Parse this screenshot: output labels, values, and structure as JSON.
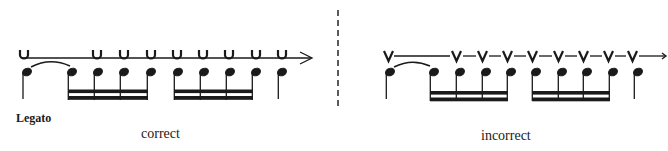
{
  "figure": {
    "section_label": "Legato",
    "panels": [
      {
        "caption": "correct",
        "bow_mark_symbol": "U",
        "bow_mark_count": 9,
        "connector_style": "continuous line with arrow",
        "note_count": 10,
        "beamed_groups": 2,
        "notes_per_group": 4
      },
      {
        "caption": "incorrect",
        "bow_mark_symbol": "V",
        "bow_mark_count": 9,
        "connector_style": "segmented line between marks with arrow",
        "note_count": 10,
        "beamed_groups": 2,
        "notes_per_group": 4
      }
    ],
    "divider": "dashed vertical line"
  }
}
